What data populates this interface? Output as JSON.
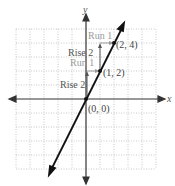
{
  "diagram": {
    "type": "coordinate-plane-line",
    "axes": {
      "x_label": "x",
      "y_label": "y"
    },
    "grid": {
      "x_min": -5,
      "x_max": 5,
      "y_min": -5,
      "y_max": 5,
      "style": "dotted"
    },
    "line": {
      "slope": 2,
      "intercept": 0,
      "equation": "y = 2x"
    },
    "points": [
      {
        "label": "(0, 0)",
        "x": 0,
        "y": 0
      },
      {
        "label": "(1, 2)",
        "x": 1,
        "y": 2
      },
      {
        "label": "(2, 4)",
        "x": 2,
        "y": 4
      }
    ],
    "annotations": [
      {
        "label": "Rise 2",
        "color": "#555555"
      },
      {
        "label": "Run 1",
        "color": "#9a9a9a"
      },
      {
        "label": "Rise 2",
        "color": "#555555"
      },
      {
        "label": "Run 1",
        "color": "#9a9a9a"
      }
    ],
    "colors": {
      "axis": "#333333",
      "line": "#111111",
      "grid": "#bbbbbb",
      "rise": "#555555",
      "run": "#9a9a9a"
    }
  }
}
